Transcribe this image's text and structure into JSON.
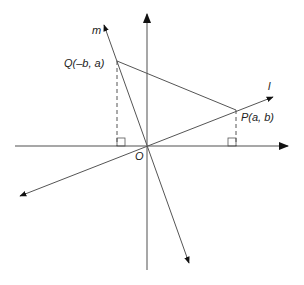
{
  "diagram": {
    "type": "coordinate-geometry",
    "colors": {
      "stroke": "#555555",
      "axis": "#8a8a8a",
      "text": "#222222"
    },
    "origin": {
      "label": "O",
      "x": 147,
      "y": 146
    },
    "axes": {
      "x": {
        "x1": 15,
        "y1": 146,
        "x2": 288,
        "y2": 146,
        "arrow": "right"
      },
      "y": {
        "x1": 147,
        "y1": 270,
        "x2": 147,
        "y2": 14,
        "arrow": "up"
      }
    },
    "lines": [
      {
        "name": "l",
        "label": "l",
        "x1": 20,
        "y1": 196,
        "x2": 273,
        "y2": 97,
        "arrows": "both"
      },
      {
        "name": "m",
        "label": "m",
        "x1": 104,
        "y1": 25,
        "x2": 189,
        "y2": 263,
        "arrows": "both"
      }
    ],
    "points": [
      {
        "name": "Q",
        "label_name": "Q",
        "label_coords": "(–b, a)",
        "x": 117,
        "y": 61
      },
      {
        "name": "P",
        "label_name": "P",
        "label_coords": "(a, b)",
        "x": 236,
        "y": 110
      }
    ],
    "segment_PQ": {
      "from": "P",
      "to": "Q"
    },
    "perpendiculars": [
      {
        "from": "Q",
        "foot_x": 117,
        "foot_y": 146,
        "dashed": true,
        "right_angle_box": "left"
      },
      {
        "from": "P",
        "foot_x": 236,
        "foot_y": 146,
        "dashed": true,
        "right_angle_box": "left"
      }
    ],
    "labels": {
      "m": "m",
      "l": "l",
      "O": "O",
      "Q": "Q(–b, a)",
      "P": "P(a, b)"
    }
  }
}
